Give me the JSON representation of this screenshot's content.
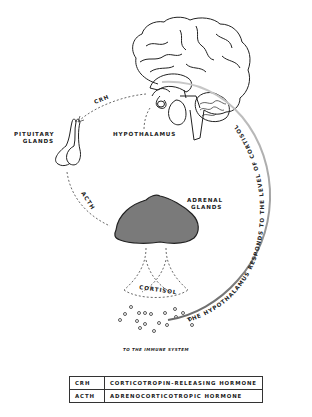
{
  "diagram": {
    "type": "hpa-axis",
    "labels": {
      "hypothalamus": "HYPOTHALAMUS",
      "pituitary_line1": "PITUITARY",
      "pituitary_line2": "GLANDS",
      "adrenal_line1": "ADRENAL",
      "adrenal_line2": "GLANDS",
      "cortisol": "CORTISOL",
      "immune": "TO THE IMMUNE SYSTEM",
      "crh_arrow": "CRH",
      "acth_arrow": "ACTH",
      "feedback": "THE HYPOTHALAMUS RESPONDS TO THE LEVEL OF CORTISOL"
    },
    "colors": {
      "outline": "#222222",
      "adrenal_fill": "#7a7a7a",
      "feedback_arc": "#8a8a8a"
    }
  },
  "legend": {
    "rows": [
      {
        "abbr": "CRH",
        "full": "CORTICOTROPIN-RELEASING HORMONE"
      },
      {
        "abbr": "ACTH",
        "full": "ADRENOCORTICOTROPIC HORMONE"
      }
    ]
  }
}
